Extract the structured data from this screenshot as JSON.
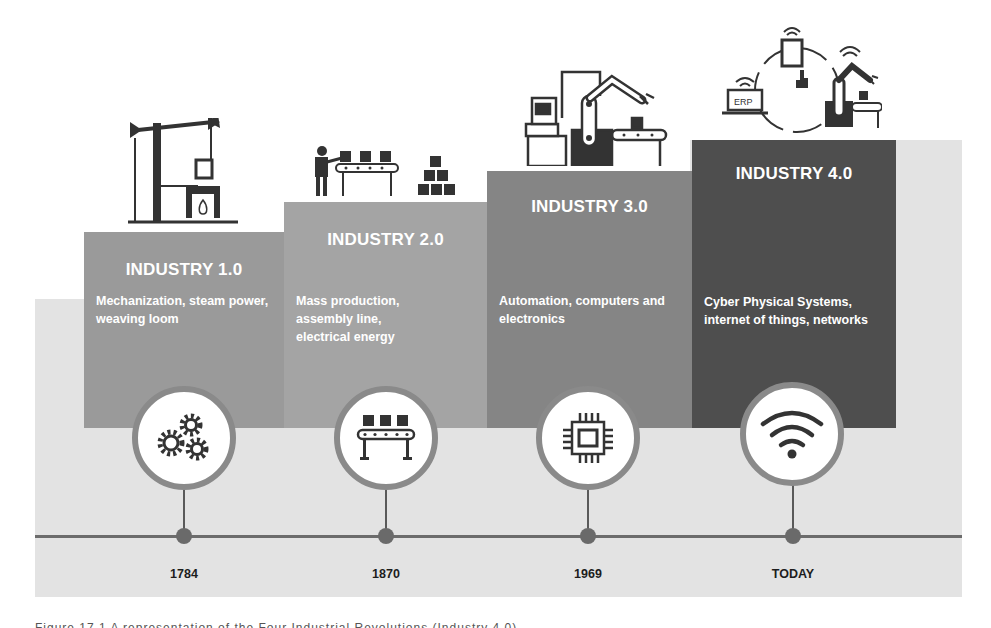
{
  "figure": {
    "stages": [
      {
        "title": "INDUSTRY 1.0",
        "description": "Mechanization, steam power, weaving loom",
        "year": "1784",
        "top_icon": "steam-engine-icon",
        "circle_icon": "gears-icon",
        "color": "#9a9a9a"
      },
      {
        "title": "INDUSTRY 2.0",
        "description": "Mass production, assembly line, electrical energy",
        "year": "1870",
        "top_icon": "assembly-line-worker-icon",
        "circle_icon": "conveyor-belt-icon",
        "color": "#a4a4a4"
      },
      {
        "title": "INDUSTRY 3.0",
        "description": "Automation, computers and electronics",
        "year": "1969",
        "top_icon": "robotic-arm-computer-icon",
        "circle_icon": "microchip-icon",
        "color": "#858585"
      },
      {
        "title": "INDUSTRY 4.0",
        "description": "Cyber Physical Systems, internet of things, networks",
        "year": "TODAY",
        "top_icon": "connected-erp-robot-icon",
        "circle_icon": "wifi-icon",
        "color": "#4e4e4e"
      }
    ],
    "erp_label": "ERP",
    "caption_partial": "Figure 17.1  A representation of the Four Industrial Revolutions (Industry 4.0)"
  }
}
